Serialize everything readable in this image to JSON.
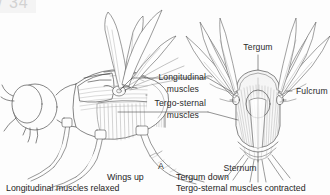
{
  "figure": {
    "corner_code": "/ 34",
    "panel_letter": "A",
    "background_color": "#fdfdfd",
    "ink_color": "#2a2a2a"
  },
  "labels": {
    "tergum": "Tergum",
    "fulcrum": "Fulcrum",
    "longitudinal_line1": "Longitudinal",
    "longitudinal_line2": "muscles",
    "tergosternal_line1": "Tergo-sternal",
    "tergosternal_line2": "muscles",
    "sternum": "Sternum"
  },
  "captions": {
    "left_line1": "Wings up",
    "left_line2": "Longitudinal muscles relaxed",
    "right_line1": "Tergum down",
    "right_line2": "Tergo-sternal muscles contracted"
  },
  "diagrams": {
    "left": {
      "name": "lateral-view-insect",
      "description": "Lateral view of insect thorax with wings raised"
    },
    "right": {
      "name": "cross-section-thorax",
      "description": "Transverse section of thorax showing tergum, sternum, fulcrum and muscles"
    }
  }
}
